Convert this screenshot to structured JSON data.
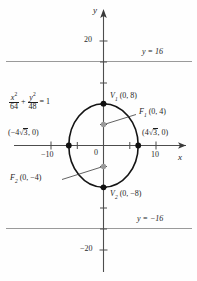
{
  "figure": {
    "axes": {
      "x_axis_label": "x",
      "y_axis_label": "y",
      "origin_label": "0",
      "x_ticks": [
        {
          "value": -10,
          "label": "−10"
        },
        {
          "value": -5,
          "label": ""
        },
        {
          "value": 5,
          "label": ""
        },
        {
          "value": 10,
          "label": "10"
        }
      ],
      "y_ticks": [
        {
          "value": 20,
          "label": "20"
        },
        {
          "value": 16,
          "label": ""
        },
        {
          "value": 12,
          "label": ""
        },
        {
          "value": 8,
          "label": ""
        },
        {
          "value": 4,
          "label": ""
        },
        {
          "value": -4,
          "label": ""
        },
        {
          "value": -8,
          "label": ""
        },
        {
          "value": -12,
          "label": ""
        },
        {
          "value": -16,
          "label": ""
        },
        {
          "value": -20,
          "label": "−20"
        }
      ]
    },
    "equation": {
      "x_num": "x",
      "x_sup": "2",
      "x_den": "64",
      "plus": "+",
      "y_num": "y",
      "y_sup": "2",
      "y_den": "48",
      "equals": "= 1"
    },
    "points": [
      {
        "name": "vertex-top",
        "label": "V",
        "sub": "1",
        "coords": "(0, 8)",
        "x": 0,
        "y": 8,
        "marker": "black"
      },
      {
        "name": "vertex-bottom",
        "label": "V",
        "sub": "2",
        "coords": "(0, −8)",
        "x": 0,
        "y": -8,
        "marker": "black"
      },
      {
        "name": "focus-top",
        "label": "F",
        "sub": "1",
        "coords": "(0, 4)",
        "x": 0,
        "y": 4,
        "marker": "gray"
      },
      {
        "name": "focus-bottom",
        "label": "F",
        "sub": "2",
        "coords": "(0, −4)",
        "x": 0,
        "y": -4,
        "marker": "gray"
      },
      {
        "name": "covertex-left",
        "label": "",
        "sub": "",
        "coords": "(−4√3, 0)",
        "x": -6.928,
        "y": 0,
        "marker": "black"
      },
      {
        "name": "covertex-right",
        "label": "",
        "sub": "",
        "coords": "(4√3, 0)",
        "x": 6.928,
        "y": 0,
        "marker": "black"
      }
    ],
    "left_covertex_label": {
      "prefix": "(−4",
      "radical": "3",
      "suffix": ", 0)"
    },
    "right_covertex_label": {
      "prefix": "(4",
      "radical": "3",
      "suffix": ", 0)"
    },
    "directrices": [
      {
        "name": "directrix-upper",
        "label": "y = 16",
        "y": 16
      },
      {
        "name": "directrix-lower",
        "label": "y = −16",
        "y": -16
      }
    ],
    "ellipse": {
      "semi_axis_x": 6.928,
      "semi_axis_y": 8,
      "center": [
        0,
        0
      ]
    },
    "colors": {
      "curve": "#1a1a1a",
      "axis": "#555555",
      "gridline": "#9a9a9a",
      "focus_marker": "#9a9a9a",
      "vertex_marker": "#111111",
      "text": "#1d1d1d",
      "background": "#fefefe"
    }
  }
}
